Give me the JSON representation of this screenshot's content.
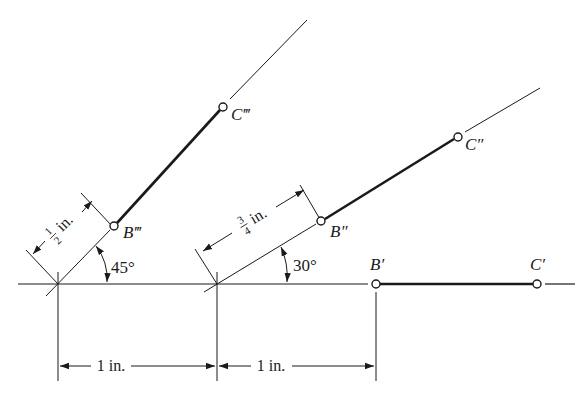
{
  "figure": {
    "type": "descriptive-geometry-construction",
    "points": {
      "B1": {
        "label": "B′",
        "x": 376,
        "y": 284
      },
      "C1": {
        "label": "C′",
        "x": 537,
        "y": 284
      },
      "B2": {
        "label": "B″",
        "x": 321,
        "y": 221
      },
      "C2": {
        "label": "C″",
        "x": 458,
        "y": 137
      },
      "B3": {
        "label": "B‴",
        "x": 114,
        "y": 226
      },
      "C3": {
        "label": "C‴",
        "x": 223,
        "y": 107
      }
    },
    "angles": {
      "a45": "45°",
      "a30": "30°"
    },
    "dimensions": {
      "offset3": {
        "num": "1",
        "den": "2",
        "unit": "in."
      },
      "offset2": {
        "num": "3",
        "den": "4",
        "unit": "in."
      },
      "spacing1": "1 in.",
      "spacing2": "1 in."
    }
  }
}
